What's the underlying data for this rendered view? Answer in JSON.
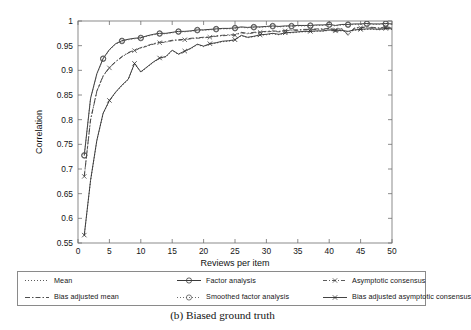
{
  "figure": {
    "caption": "(b) Biased ground truth"
  },
  "chart_data": {
    "type": "line",
    "title": "",
    "xlabel": "Reviews per item",
    "ylabel": "Correlation",
    "xlim": [
      0,
      50
    ],
    "ylim": [
      0.55,
      1
    ],
    "xticks": [
      0,
      5,
      10,
      15,
      20,
      25,
      30,
      35,
      40,
      45,
      50
    ],
    "xticklabels": [
      "0",
      "5",
      "10",
      "15",
      "20",
      "25",
      "30",
      "35",
      "40",
      "45",
      "50"
    ],
    "yticks": [
      0.55,
      0.6,
      0.65,
      0.7,
      0.75,
      0.8,
      0.85,
      0.9,
      0.95,
      1
    ],
    "yticklabels": [
      "0.55",
      "0.6",
      "0.65",
      "0.7",
      "0.75",
      "0.8",
      "0.85",
      "0.9",
      "0.95",
      "1"
    ],
    "grid": false,
    "legend_position": "below-axes",
    "x": [
      1,
      2,
      3,
      4,
      5,
      6,
      7,
      8,
      9,
      10,
      11,
      12,
      13,
      14,
      15,
      16,
      17,
      18,
      19,
      20,
      21,
      22,
      23,
      24,
      25,
      26,
      27,
      28,
      29,
      30,
      31,
      32,
      33,
      34,
      35,
      36,
      37,
      38,
      39,
      40,
      41,
      42,
      43,
      44,
      45,
      46,
      47,
      48,
      49,
      50
    ],
    "series": [
      {
        "name": "Mean",
        "color": "#4a4a4a",
        "dash": "1,2",
        "marker": "none",
        "width": 0.9,
        "values": [
          0.565,
          0.676,
          0.757,
          0.812,
          0.838,
          0.855,
          0.869,
          0.881,
          0.913,
          0.896,
          0.906,
          0.916,
          0.924,
          0.927,
          0.94,
          0.932,
          0.938,
          0.944,
          0.952,
          0.948,
          0.953,
          0.955,
          0.958,
          0.959,
          0.961,
          0.97,
          0.966,
          0.968,
          0.971,
          0.972,
          0.974,
          0.972,
          0.975,
          0.976,
          0.977,
          0.978,
          0.978,
          0.979,
          0.979,
          0.981,
          0.979,
          0.98,
          0.978,
          0.981,
          0.982,
          0.983,
          0.983,
          0.982,
          0.984,
          0.983
        ]
      },
      {
        "name": "Bias adjusted mean",
        "color": "#3b3b3b",
        "dash": "5,2,1.5,2",
        "marker": "none",
        "width": 0.9,
        "values": [
          0.686,
          0.8,
          0.858,
          0.889,
          0.906,
          0.918,
          0.928,
          0.936,
          0.941,
          0.946,
          0.95,
          0.954,
          0.957,
          0.958,
          0.961,
          0.962,
          0.963,
          0.965,
          0.966,
          0.967,
          0.968,
          0.97,
          0.971,
          0.972,
          0.972,
          0.977,
          0.975,
          0.977,
          0.978,
          0.979,
          0.98,
          0.979,
          0.981,
          0.982,
          0.982,
          0.983,
          0.983,
          0.984,
          0.984,
          0.985,
          0.983,
          0.985,
          0.972,
          0.986,
          0.987,
          0.988,
          0.987,
          0.986,
          0.988,
          0.987
        ]
      },
      {
        "name": "Factor analysis",
        "color": "#3a3a3a",
        "dash": "none",
        "marker": "circle",
        "width": 1.0,
        "values": [
          0.728,
          0.843,
          0.893,
          0.924,
          0.942,
          0.954,
          0.96,
          0.963,
          0.965,
          0.966,
          0.97,
          0.973,
          0.975,
          0.975,
          0.977,
          0.979,
          0.979,
          0.98,
          0.982,
          0.982,
          0.983,
          0.984,
          0.985,
          0.985,
          0.986,
          0.988,
          0.987,
          0.988,
          0.988,
          0.989,
          0.99,
          0.989,
          0.99,
          0.99,
          0.991,
          0.991,
          0.991,
          0.992,
          0.992,
          0.993,
          0.991,
          0.993,
          0.993,
          0.994,
          0.994,
          0.995,
          0.994,
          0.994,
          0.995,
          0.994
        ]
      },
      {
        "name": "Smoothed factor analysis",
        "color": "#5a5a5a",
        "dash": "1,2",
        "marker": "circle-open",
        "width": 0.9,
        "values": [
          0.727,
          0.842,
          0.892,
          0.923,
          0.941,
          0.953,
          0.959,
          0.962,
          0.964,
          0.965,
          0.969,
          0.972,
          0.974,
          0.974,
          0.976,
          0.978,
          0.978,
          0.979,
          0.981,
          0.981,
          0.982,
          0.983,
          0.984,
          0.984,
          0.985,
          0.987,
          0.986,
          0.987,
          0.987,
          0.988,
          0.989,
          0.988,
          0.989,
          0.989,
          0.99,
          0.99,
          0.99,
          0.991,
          0.991,
          0.992,
          0.99,
          0.992,
          0.992,
          0.993,
          0.993,
          0.994,
          0.993,
          0.993,
          0.994,
          0.993
        ]
      },
      {
        "name": "Asymptotic consensus",
        "color": "#4a4a4a",
        "dash": "4,2,1,2",
        "marker": "x",
        "width": 0.9,
        "values": [
          0.685,
          0.799,
          0.857,
          0.888,
          0.905,
          0.917,
          0.927,
          0.935,
          0.94,
          0.945,
          0.949,
          0.953,
          0.956,
          0.957,
          0.96,
          0.961,
          0.962,
          0.964,
          0.965,
          0.966,
          0.967,
          0.969,
          0.97,
          0.971,
          0.971,
          0.976,
          0.974,
          0.976,
          0.977,
          0.978,
          0.979,
          0.978,
          0.98,
          0.981,
          0.981,
          0.982,
          0.982,
          0.983,
          0.983,
          0.984,
          0.982,
          0.984,
          0.971,
          0.985,
          0.986,
          0.987,
          0.986,
          0.985,
          0.987,
          0.986
        ]
      },
      {
        "name": "Bias adjusted asymptotic consensus",
        "color": "#2e2e2e",
        "dash": "none",
        "marker": "x",
        "width": 0.9,
        "values": [
          0.566,
          0.677,
          0.758,
          0.813,
          0.839,
          0.856,
          0.87,
          0.882,
          0.914,
          0.897,
          0.907,
          0.917,
          0.925,
          0.928,
          0.941,
          0.933,
          0.939,
          0.945,
          0.953,
          0.949,
          0.954,
          0.956,
          0.959,
          0.96,
          0.962,
          0.971,
          0.967,
          0.969,
          0.972,
          0.973,
          0.975,
          0.973,
          0.976,
          0.977,
          0.978,
          0.979,
          0.979,
          0.98,
          0.98,
          0.982,
          0.98,
          0.981,
          0.979,
          0.982,
          0.983,
          0.984,
          0.984,
          0.983,
          0.985,
          0.984
        ]
      }
    ]
  },
  "legend": {
    "entries": [
      {
        "label": "Mean",
        "sample": "dotted-line",
        "series_index": 0
      },
      {
        "label": "Factor analysis",
        "sample": "solid-line-circle-marker",
        "series_index": 2
      },
      {
        "label": "Asymptotic consensus",
        "sample": "dashdot-line-x-marker",
        "series_index": 4
      },
      {
        "label": "Bias adjusted mean",
        "sample": "dashdot-line",
        "series_index": 1
      },
      {
        "label": "Smoothed factor analysis",
        "sample": "dotted-line-circle-marker",
        "series_index": 3
      },
      {
        "label": "Bias adjusted asymptotic consensus",
        "sample": "solid-line-x-marker",
        "series_index": 5
      }
    ]
  }
}
